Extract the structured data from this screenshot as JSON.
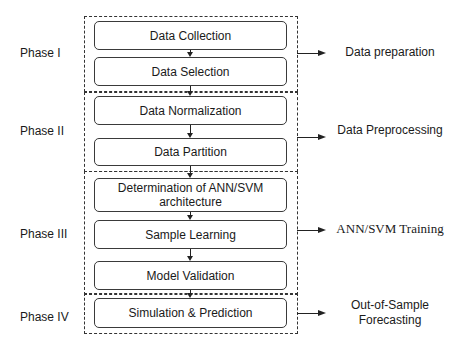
{
  "phases": [
    {
      "label": "Phase I",
      "output": "Data preparation"
    },
    {
      "label": "Phase II",
      "output": "Data Preprocessing"
    },
    {
      "label": "Phase III",
      "output": "ANN/SVM Training"
    },
    {
      "label": "Phase IV",
      "output": "Out-of-Sample Forecasting"
    }
  ],
  "steps": [
    "Data Collection",
    "Data Selection",
    "Data Normalization",
    "Data Partition",
    "Determination of ANN/SVM architecture",
    "Sample Learning",
    "Model Validation",
    "Simulation & Prediction"
  ],
  "colors": {
    "line": "#333333",
    "text": "#1a1a1a",
    "background": "#ffffff"
  }
}
